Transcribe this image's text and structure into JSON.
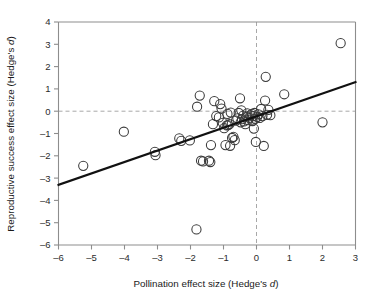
{
  "chart_data": {
    "type": "scatter",
    "title": "",
    "xlabel": "Pollination effect size (Hedge's d)",
    "ylabel": "Reproductive success effect size (Hedge's d)",
    "xlabel_parts": {
      "pre": "Pollination effect size (Hedge's ",
      "italic": "d",
      "post": ")"
    },
    "ylabel_parts": {
      "pre": "Reproductive success effect size (Hedge's ",
      "italic": "d",
      "post": ")"
    },
    "xlim": [
      -6,
      3
    ],
    "ylim": [
      -6,
      4
    ],
    "xticks": [
      -6,
      -5,
      -4,
      -3,
      -2,
      -1,
      0,
      1,
      2,
      3
    ],
    "yticks": [
      -6,
      -5,
      -4,
      -3,
      -2,
      -1,
      0,
      1,
      2,
      3,
      4
    ],
    "xticklabels": [
      "–6",
      "–5",
      "–4",
      "–3",
      "–2",
      "–1",
      "0",
      "1",
      "2",
      "3"
    ],
    "yticklabels": [
      "–6",
      "–5",
      "–4",
      "–3",
      "–2",
      "–1",
      "0",
      "1",
      "2",
      "3",
      "4"
    ],
    "grid": false,
    "legend": null,
    "marker": "open-circle",
    "marker_color": "#3a3a3a",
    "marker_size": 4.6,
    "reference_lines": [
      {
        "orientation": "horizontal",
        "value": 0,
        "style": "dashed",
        "color": "#a8a8a8"
      },
      {
        "orientation": "vertical",
        "value": 0,
        "style": "dashed",
        "color": "#a8a8a8"
      }
    ],
    "fit_line": {
      "type": "linear-regression",
      "color": "#111111",
      "x_start": -6,
      "y_start": -3.3,
      "x_end": 3,
      "y_end": 1.3,
      "slope": 0.511,
      "intercept": -0.233
    },
    "points": [
      [
        -5.25,
        -2.45
      ],
      [
        -4.02,
        -0.92
      ],
      [
        -3.08,
        -1.82
      ],
      [
        -3.06,
        -1.97
      ],
      [
        -2.34,
        -1.22
      ],
      [
        -2.28,
        -1.33
      ],
      [
        -2.02,
        -1.31
      ],
      [
        -1.82,
        -5.3
      ],
      [
        -1.8,
        0.2
      ],
      [
        -1.72,
        0.7
      ],
      [
        -1.68,
        -2.22
      ],
      [
        -1.62,
        -2.25
      ],
      [
        -1.44,
        -2.22
      ],
      [
        -1.4,
        -2.28
      ],
      [
        -1.38,
        -1.52
      ],
      [
        -1.32,
        -0.58
      ],
      [
        -1.28,
        0.45
      ],
      [
        -1.22,
        -0.22
      ],
      [
        -1.14,
        -0.28
      ],
      [
        -1.1,
        0.32
      ],
      [
        -1.06,
        0.12
      ],
      [
        -1.02,
        -0.52
      ],
      [
        -0.98,
        -0.76
      ],
      [
        -0.94,
        -1.52
      ],
      [
        -0.9,
        -0.64
      ],
      [
        -0.88,
        -0.12
      ],
      [
        -0.86,
        -0.62
      ],
      [
        -0.82,
        -0.58
      ],
      [
        -0.8,
        -1.55
      ],
      [
        -0.78,
        -0.06
      ],
      [
        -0.74,
        -1.2
      ],
      [
        -0.7,
        -1.15
      ],
      [
        -0.66,
        -1.3
      ],
      [
        -0.62,
        -0.42
      ],
      [
        -0.58,
        -0.32
      ],
      [
        -0.54,
        -0.08
      ],
      [
        -0.5,
        0.58
      ],
      [
        -0.48,
        -0.5
      ],
      [
        -0.46,
        0.04
      ],
      [
        -0.44,
        -0.36
      ],
      [
        -0.4,
        -0.2
      ],
      [
        -0.38,
        -0.46
      ],
      [
        -0.34,
        -0.58
      ],
      [
        -0.3,
        -0.24
      ],
      [
        -0.28,
        -0.1
      ],
      [
        -0.26,
        -0.4
      ],
      [
        -0.22,
        -0.3
      ],
      [
        -0.18,
        -0.18
      ],
      [
        -0.14,
        -0.12
      ],
      [
        -0.12,
        -0.44
      ],
      [
        -0.1,
        -0.22
      ],
      [
        -0.08,
        -0.78
      ],
      [
        -0.06,
        -0.08
      ],
      [
        -0.04,
        -0.34
      ],
      [
        -0.02,
        -1.38
      ],
      [
        0.02,
        -0.26
      ],
      [
        0.06,
        -0.14
      ],
      [
        0.1,
        -0.3
      ],
      [
        0.14,
        0.1
      ],
      [
        0.18,
        -0.22
      ],
      [
        0.22,
        -1.56
      ],
      [
        0.26,
        0.48
      ],
      [
        0.28,
        1.54
      ],
      [
        0.32,
        -0.16
      ],
      [
        0.36,
        0.06
      ],
      [
        0.42,
        -0.18
      ],
      [
        0.84,
        0.76
      ],
      [
        2.0,
        -0.5
      ],
      [
        2.55,
        3.05
      ]
    ],
    "n_points": 69
  },
  "accent_colors": {
    "frame": "#8d8d8d",
    "reference": "#a8a8a8",
    "fit": "#111111",
    "marker": "#3a3a3a",
    "text": "#1a1a1a",
    "background": "#ffffff"
  }
}
